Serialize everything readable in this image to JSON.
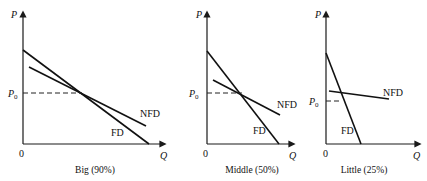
{
  "diagram": {
    "axis_labels": {
      "y": "P",
      "x": "Q",
      "origin": "0",
      "price_level": "P",
      "price_sub": "0"
    },
    "curve_labels": {
      "fd": "FD",
      "nfd": "NFD"
    },
    "panels": [
      {
        "id": "big",
        "caption": "Big (90%)"
      },
      {
        "id": "middle",
        "caption": "Middle (50%)"
      },
      {
        "id": "little",
        "caption": "Little (25%)"
      }
    ]
  }
}
